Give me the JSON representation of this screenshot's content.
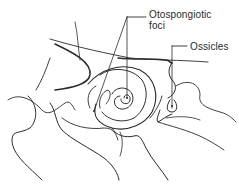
{
  "figure": {
    "type": "anatomical line drawing",
    "labels": {
      "foci_line1": "Otospongiotic",
      "foci_line2": "foci",
      "ossicles": "Ossicles"
    },
    "colors": {
      "background": "#ffffff",
      "stroke": "#2a2a2a",
      "text": "#2a2a2a"
    }
  }
}
